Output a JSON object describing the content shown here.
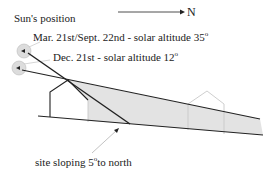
{
  "title": "Sun's position",
  "north_label": "N",
  "labels": {
    "equinox": "Mar. 21st/Sept. 22nd - solar altitude 35",
    "equinox_deg": "o",
    "winter": "Dec. 21st - solar altitude 12",
    "winter_deg": "o",
    "slope_prefix": "site sloping 5",
    "slope_deg": "o",
    "slope_suffix": "to north"
  },
  "colors": {
    "line": "#222222",
    "shade": "#e3e3e3",
    "gray_house": "#c8c8c8",
    "sun": "#dcdcdc"
  }
}
